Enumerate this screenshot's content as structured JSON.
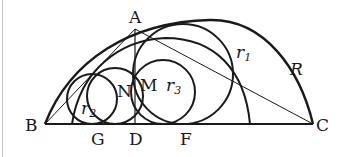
{
  "diagram": {
    "points": {
      "A": "A",
      "B": "B",
      "C": "C",
      "D": "D",
      "F": "F",
      "G": "G",
      "M": "M",
      "N": "N"
    },
    "radii": {
      "R": "R",
      "r1_base": "r",
      "r1_sub": "1",
      "r2_base": "r",
      "r2_sub": "2",
      "r3_base": "r",
      "r3_sub": "3"
    },
    "colors": {
      "stroke": "#1a1a1a",
      "background": "#ffffff"
    }
  }
}
